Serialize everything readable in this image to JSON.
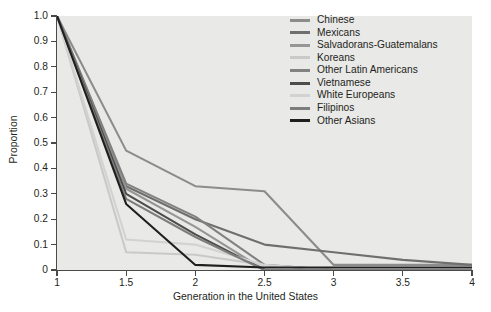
{
  "chart_data": {
    "type": "line",
    "title": "",
    "xlabel": "Generation in the United States",
    "ylabel": "Proportion",
    "xlim": [
      1,
      4
    ],
    "ylim": [
      0,
      1.0
    ],
    "x": [
      1,
      1.5,
      2,
      2.5,
      3,
      3.5,
      4
    ],
    "xticklabels": [
      "1",
      "1.5",
      "2",
      "2.5",
      "3",
      "3.5",
      "4"
    ],
    "yticklabels": [
      "0",
      "0.1",
      "0.2",
      "0.3",
      "0.4",
      "0.5",
      "0.6",
      "0.7",
      "0.8",
      "0.9",
      "1.0"
    ],
    "ytickvalues": [
      0,
      0.1,
      0.2,
      0.3,
      0.4,
      0.5,
      0.6,
      0.7,
      0.8,
      0.9,
      1.0
    ],
    "grid": false,
    "legend_position": "top-right",
    "plot_background": "#e9e9e7",
    "series": [
      {
        "name": "Chinese",
        "color": "#8c8c8c",
        "values": [
          1.0,
          0.47,
          0.33,
          0.31,
          0.02,
          0.02,
          0.02
        ]
      },
      {
        "name": "Mexicans",
        "color": "#6f6f6f",
        "values": [
          1.0,
          0.33,
          0.2,
          0.1,
          0.07,
          0.04,
          0.02
        ]
      },
      {
        "name": "Salvadorans-Guatemalans",
        "color": "#969696",
        "values": [
          1.0,
          0.32,
          0.17,
          0.0,
          0.0,
          0.0,
          0.0
        ]
      },
      {
        "name": "Koreans",
        "color": "#c9c9c9",
        "values": [
          1.0,
          0.07,
          0.06,
          0.02,
          0.0,
          0.0,
          0.0
        ]
      },
      {
        "name": "Other Latin Americans",
        "color": "#828282",
        "values": [
          1.0,
          0.34,
          0.21,
          0.02,
          0.0,
          0.0,
          0.0
        ]
      },
      {
        "name": "Vietnamese",
        "color": "#4d4d4d",
        "values": [
          1.0,
          0.3,
          0.14,
          0.0,
          0.0,
          0.0,
          0.0
        ]
      },
      {
        "name": "White Europeans",
        "color": "#d2d2d2",
        "values": [
          1.0,
          0.12,
          0.1,
          0.02,
          0.0,
          0.0,
          0.0
        ]
      },
      {
        "name": "Filipinos",
        "color": "#7d7d7d",
        "values": [
          1.0,
          0.28,
          0.13,
          0.0,
          0.0,
          0.0,
          0.0
        ]
      },
      {
        "name": "Other Asians",
        "color": "#1f1f1f",
        "values": [
          1.0,
          0.26,
          0.02,
          0.01,
          0.01,
          0.01,
          0.01
        ]
      }
    ]
  },
  "caption": ""
}
